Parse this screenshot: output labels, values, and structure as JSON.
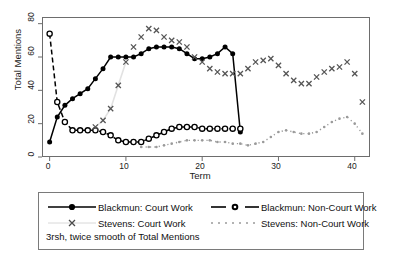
{
  "chart_data": {
    "type": "line",
    "title": "",
    "subtitle": "",
    "xlabel": "Term",
    "ylabel": "Total Mentions",
    "xlim": [
      -1,
      42
    ],
    "ylim": [
      0,
      84
    ],
    "xticks": [
      0,
      10,
      20,
      30,
      40
    ],
    "yticks": [
      0,
      20,
      40,
      60,
      80
    ],
    "grid": false,
    "legend_position": "below-plot",
    "annotation": "3rsh, twice smooth of Total Mentions",
    "series": [
      {
        "name": "Blackmun: Court Work",
        "marker": "filled-circle",
        "line": "solid",
        "color": "#000000",
        "x": [
          0,
          1,
          2,
          3,
          4,
          5,
          6,
          7,
          8,
          9,
          10,
          11,
          12,
          13,
          14,
          15,
          16,
          17,
          18,
          19,
          20,
          21,
          22,
          23,
          24,
          25
        ],
        "values": [
          9,
          24,
          31,
          35,
          38,
          41,
          47,
          53,
          60,
          60,
          60,
          60,
          62,
          65,
          66,
          66,
          66,
          65,
          62,
          59,
          59,
          60,
          62,
          66,
          62,
          15
        ]
      },
      {
        "name": "Blackmun: Non-Court Work",
        "marker": "open-circle",
        "line": "dashed",
        "color": "#000000",
        "x": [
          0,
          1,
          2,
          3,
          4,
          5,
          6,
          7,
          8,
          9,
          10,
          11,
          12,
          13,
          14,
          15,
          16,
          17,
          18,
          19,
          20,
          21,
          22,
          23,
          24,
          25
        ],
        "values": [
          74,
          33,
          21,
          16,
          16,
          16,
          16,
          15,
          13,
          10,
          9,
          9,
          9,
          11,
          13,
          15,
          17,
          18,
          18,
          18,
          17,
          17,
          17,
          17,
          17,
          17
        ]
      },
      {
        "name": "Stevens: Court Work",
        "marker": "cross",
        "line": "none",
        "color": "#555555",
        "x": [
          6,
          7,
          8,
          9,
          10,
          11,
          12,
          13,
          14,
          15,
          16,
          17,
          18,
          19,
          20,
          21,
          22,
          23,
          24,
          25,
          26,
          27,
          28,
          29,
          30,
          31,
          32,
          33,
          34,
          35,
          36,
          37,
          38,
          39,
          40,
          41
        ],
        "values": [
          18,
          22,
          29,
          43,
          57,
          66,
          72,
          77,
          76,
          72,
          70,
          69,
          66,
          60,
          57,
          53,
          51,
          50,
          50,
          50,
          53,
          57,
          58,
          59,
          55,
          50,
          46,
          44,
          44,
          48,
          51,
          53,
          54,
          57,
          50,
          33
        ]
      },
      {
        "name": "Stevens: Non-Court Work",
        "marker": "dot",
        "line": "dotted",
        "color": "#9a9a9a",
        "x": [
          12,
          13,
          14,
          15,
          16,
          17,
          18,
          19,
          20,
          21,
          22,
          23,
          24,
          25,
          26,
          27,
          28,
          29,
          30,
          31,
          32,
          33,
          34,
          35,
          36,
          37,
          38,
          39,
          40,
          41
        ],
        "values": [
          6,
          6,
          6,
          7,
          8,
          9,
          10,
          10,
          10,
          10,
          9,
          9,
          8,
          8,
          7,
          8,
          9,
          12,
          15,
          16,
          15,
          14,
          14,
          15,
          18,
          21,
          23,
          24,
          20,
          14
        ]
      }
    ]
  },
  "axis": {
    "ylabel": "Total Mentions",
    "xlabel": "Term",
    "yticks": [
      "0",
      "20",
      "40",
      "60",
      "80"
    ],
    "xticks": [
      "0",
      "10",
      "20",
      "30",
      "40"
    ]
  },
  "legend": {
    "entries": [
      {
        "label": "Blackmun: Court Work"
      },
      {
        "label": "Blackmun: Non-Court Work"
      },
      {
        "label": "Stevens: Court Work"
      },
      {
        "label": "Stevens: Non-Court Work"
      }
    ],
    "note": "3rsh, twice smooth of Total Mentions"
  }
}
